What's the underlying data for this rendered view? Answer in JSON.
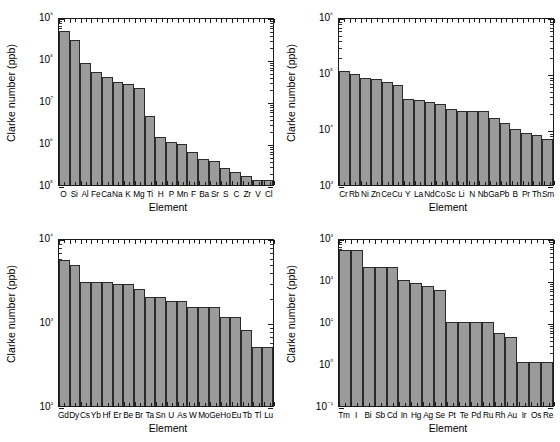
{
  "figure": {
    "axis_titles": {
      "y": "Clarke number (ppb)",
      "x": "Element"
    },
    "bar_color": "#9b9b9b",
    "bar_edge_color": "#2b2b2b"
  },
  "chart_data": [
    {
      "type": "bar",
      "panel": "top-left",
      "title": "",
      "xlabel": "Element",
      "ylabel": "Clarke number (ppb)",
      "yscale": "log",
      "ylim": [
        100000,
        1000000000
      ],
      "ytick_labels": [
        "10⁵",
        "10⁶",
        "10⁷",
        "10⁸",
        "10⁹"
      ],
      "ytick_values": [
        100000,
        1000000,
        10000000,
        100000000,
        1000000000
      ],
      "grid": false,
      "legend": "none",
      "categories": [
        "O",
        "Si",
        "Al",
        "Fe",
        "Ca",
        "Na",
        "K",
        "Mg",
        "Ti",
        "H",
        "P",
        "Mn",
        "F",
        "Ba",
        "Sr",
        "S",
        "C",
        "Zr",
        "V",
        "Cl"
      ],
      "values": [
        466000000,
        277000000,
        81300000,
        50000000,
        36300000,
        28300000,
        25900000,
        20900000,
        4400000,
        1400000,
        1050000,
        950000,
        625000,
        425000,
        375000,
        260000,
        200000,
        165000,
        135000,
        130000
      ]
    },
    {
      "type": "bar",
      "panel": "top-right",
      "title": "",
      "xlabel": "Element",
      "ylabel": "Clarke number (ppb)",
      "yscale": "log",
      "ylim": [
        1000,
        1000000
      ],
      "ytick_labels": [
        "10³",
        "10⁴",
        "10⁵",
        "10⁶"
      ],
      "ytick_values": [
        1000,
        10000,
        100000,
        1000000
      ],
      "grid": false,
      "legend": "none",
      "categories": [
        "Cr",
        "Rb",
        "Ni",
        "Zn",
        "Ce",
        "Cu",
        "Y",
        "La",
        "Nd",
        "Co",
        "Sc",
        "Li",
        "N",
        "Nb",
        "Ga",
        "Pb",
        "B",
        "Pr",
        "Th",
        "Sm"
      ],
      "values": [
        110000,
        95000,
        82000,
        77000,
        68000,
        61000,
        35000,
        33000,
        30000,
        28000,
        23000,
        21000,
        21000,
        21000,
        16000,
        13000,
        10000,
        8500,
        7700,
        6500
      ]
    },
    {
      "type": "bar",
      "panel": "bottom-left",
      "title": "",
      "xlabel": "Element",
      "ylabel": "Clarke number (ppb)",
      "yscale": "log",
      "ylim": [
        100,
        10000
      ],
      "ytick_labels": [
        "10²",
        "10³",
        "10⁴"
      ],
      "ytick_values": [
        100,
        1000,
        10000
      ],
      "grid": false,
      "legend": "none",
      "categories": [
        "Gd",
        "Dy",
        "Cs",
        "Yb",
        "Hf",
        "Er",
        "Be",
        "Br",
        "Ta",
        "Sn",
        "U",
        "As",
        "W",
        "Mo",
        "Ge",
        "Ho",
        "Eu",
        "Tb",
        "Tl",
        "Lu"
      ],
      "values": [
        5400,
        4800,
        3000,
        3000,
        3000,
        2800,
        2800,
        2500,
        2000,
        2000,
        1800,
        1800,
        1500,
        1500,
        1500,
        1150,
        1150,
        800,
        500,
        500
      ]
    },
    {
      "type": "bar",
      "panel": "bottom-right",
      "title": "",
      "xlabel": "Element",
      "ylabel": "Clarke number (ppb)",
      "yscale": "log",
      "ylim": [
        0.1,
        1000
      ],
      "ytick_labels": [
        "10⁻¹",
        "10⁰",
        "10¹",
        "10²",
        "10³"
      ],
      "ytick_values": [
        0.1,
        1,
        10,
        100,
        1000
      ],
      "grid": false,
      "legend": "none",
      "categories": [
        "Tm",
        "I",
        "Bi",
        "Sb",
        "Cd",
        "In",
        "Hg",
        "Ag",
        "Se",
        "Pt",
        "Te",
        "Pd",
        "Ru",
        "Rh",
        "Au",
        "Ir",
        "Os",
        "Re"
      ],
      "values": [
        520,
        520,
        200,
        200,
        200,
        100,
        85,
        72,
        57,
        10,
        10,
        10,
        10,
        5.5,
        4.5,
        1.1,
        1.1,
        1.1
      ]
    }
  ]
}
